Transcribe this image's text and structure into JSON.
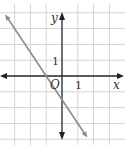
{
  "chart_data": {
    "type": "line",
    "title": "",
    "xlabel": "x",
    "ylabel": "y",
    "origin_label": "O",
    "xlim": [
      -3.5,
      3.5
    ],
    "ylim": [
      -4.5,
      4.5
    ],
    "grid": true,
    "x_tick_labels": [
      {
        "value": 1,
        "label": "1"
      }
    ],
    "y_tick_labels": [
      {
        "value": 1,
        "label": "1"
      }
    ],
    "series": [
      {
        "name": "line",
        "equation": "y = -1.5x - 1.5",
        "points": [
          [
            -3.6,
            3.9
          ],
          [
            1.6,
            -3.9
          ]
        ],
        "color": "#8c8c8c"
      }
    ],
    "colors": {
      "axis": "#222222",
      "grid": "#d4d4d4",
      "line": "#8c8c8c"
    }
  }
}
